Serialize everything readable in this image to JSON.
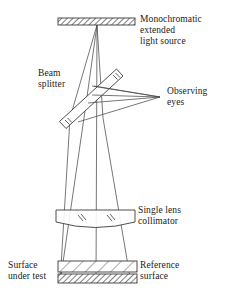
{
  "figure": {
    "type": "optical-ray-diagram",
    "background_color": "#ffffff",
    "line_color": "#3a3a3a",
    "text_color": "#1a1a1a",
    "width": 229,
    "height": 297
  },
  "labels": {
    "light_source": "Monochromatic\nextended\nlight source",
    "beam_splitter": "Beam\nsplitter",
    "observing_eyes": "Observing\neyes",
    "collimator": "Single lens\ncollimator",
    "surface_under_test": "Surface\nunder test",
    "reference_surface": "Reference\nsurface"
  },
  "components": {
    "light_source_bar": {
      "name": "Monochromatic extended light source",
      "x": 58,
      "y": 18,
      "width": 77,
      "height": 7,
      "fill": "hatched-dense"
    },
    "beam_splitter_plate": {
      "name": "Beam splitter",
      "from_x": 62,
      "from_y": 120,
      "to_x": 120,
      "to_y": 70,
      "thickness": 9,
      "fill": "hatch-marks-at-ends"
    },
    "collimator_lens": {
      "name": "Single lens collimator",
      "x": 56,
      "y": 210,
      "width": 79,
      "height": 18,
      "shape": "plano-convex",
      "hatch_marks": 2
    },
    "reference_surface_plate": {
      "name": "Reference surface",
      "x": 58,
      "y": 261,
      "width": 79,
      "height": 11,
      "fill": "hatched-sparse"
    },
    "surface_under_test_plate": {
      "name": "Surface under test",
      "x": 58,
      "y": 274,
      "width": 79,
      "height": 9,
      "fill": "hatched-dense"
    }
  },
  "rays": {
    "source_to_splitter": "converging beam from extended source down to beam splitter",
    "splitter_to_lens": "diverging beam from beam splitter down through collimator lens",
    "lens_to_surfaces": "collimated beam from lens to reference surface and surface under test",
    "splitter_to_eyes": "reflected rays converging to observing eyes at right"
  }
}
